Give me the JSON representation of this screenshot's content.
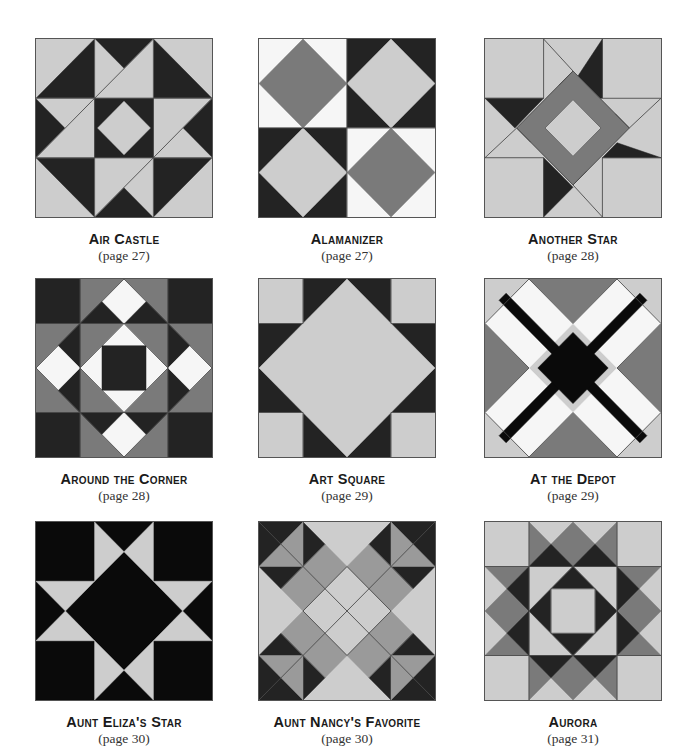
{
  "colors": {
    "L": "#cdcdcd",
    "D": "#232323",
    "M": "#7a7a7a",
    "G": "#9a9a9a",
    "W": "#f6f6f6",
    "K": "#0a0a0a",
    "line": "#4a4a4a"
  },
  "blocks": [
    {
      "title": "Air Castle",
      "page": "(page 27)",
      "x": 35,
      "y": 38,
      "shapes": [
        [
          "L",
          "0,0 100,0 100,100 0,100"
        ],
        [
          "D",
          "0,33.3 33.3,0 33.3,33.3"
        ],
        [
          "D",
          "66.7,0 100,33.3 66.7,33.3"
        ],
        [
          "D",
          "0,66.7 33.3,66.7 33.3,100"
        ],
        [
          "D",
          "66.7,66.7 100,66.7 66.7,100"
        ],
        [
          "D",
          "33.3,0 66.7,0 50,16.7"
        ],
        [
          "L",
          "33.3,0 50,16.7 33.3,33.3"
        ],
        [
          "L",
          "66.7,0 66.7,33.3 33.3,33.3 50,16.7"
        ],
        [
          "D",
          "0,33.3 16.7,50 0,66.7"
        ],
        [
          "L",
          "0,33.3 33.3,33.3 16.7,50"
        ],
        [
          "L",
          "16.7,50 33.3,33.3 33.3,66.7 0,66.7"
        ],
        [
          "D",
          "100,33.3 100,66.7 83.3,50"
        ],
        [
          "L",
          "66.7,33.3 100,33.3 83.3,50 66.7,66.7"
        ],
        [
          "L",
          "83.3,50 100,66.7 66.7,66.7"
        ],
        [
          "D",
          "33.3,100 50,83.3 66.7,100"
        ],
        [
          "L",
          "33.3,66.7 66.7,66.7 50,83.3 33.3,100"
        ],
        [
          "L",
          "50,83.3 66.7,66.7 66.7,100"
        ],
        [
          "D",
          "33.3,33.3 66.7,33.3 66.7,66.7 33.3,66.7"
        ],
        [
          "L",
          "50,35 65,50 50,65 35,50"
        ]
      ],
      "lines": [
        "33.3,0 33.3,100",
        "66.7,0 66.7,100",
        "0,33.3 100,33.3",
        "0,66.7 100,66.7",
        "33.3,33.3 66.7,0",
        "0,66.7 33.3,33.3",
        "66.7,66.7 100,33.3",
        "33.3,100 66.7,66.7"
      ]
    },
    {
      "title": "Alamanizer",
      "page": "(page 27)",
      "x": 258,
      "y": 38,
      "shapes": [
        [
          "W",
          "0,0 50,0 50,50 0,50"
        ],
        [
          "M",
          "25,0 50,25 25,50 0,25"
        ],
        [
          "D",
          "50,0 100,0 100,50 50,50"
        ],
        [
          "L",
          "75,0 100,25 75,50 50,25"
        ],
        [
          "D",
          "0,50 50,50 50,100 0,100"
        ],
        [
          "L",
          "25,50 50,75 25,100 0,75"
        ],
        [
          "W",
          "50,50 100,50 100,100 50,100"
        ],
        [
          "M",
          "75,50 100,75 75,100 50,75"
        ]
      ],
      "lines": [
        "50,0 50,100",
        "0,50 100,50"
      ]
    },
    {
      "title": "Another Star",
      "page": "(page 28)",
      "x": 484,
      "y": 38,
      "shapes": [
        [
          "L",
          "0,0 100,0 100,100 0,100"
        ],
        [
          "D",
          "50,25 66.7,0 66.7,33.3 58,33.3"
        ],
        [
          "D",
          "0,33.3 33.3,33.3 25,41.7 17,50"
        ],
        [
          "D",
          "75,58.3 100,66.7 66.7,66.7"
        ],
        [
          "D",
          "33.3,66.7 41.7,75 50,83.3 33.3,100"
        ],
        [
          "M",
          "50,25 75,50 50,75 25,50"
        ],
        [
          "M",
          "50,18 82,50 50,82 18,50"
        ],
        [
          "L",
          "50,34 66,50 50,66 34,50"
        ]
      ],
      "lines": [
        "33.3,0 33.3,33.3",
        "66.7,0 66.7,33.3",
        "0,33.3 33.3,33.3",
        "66.7,33.3 100,33.3",
        "0,66.7 33.3,66.7",
        "66.7,66.7 100,66.7",
        "33.3,66.7 33.3,100",
        "66.7,66.7 66.7,100",
        "33.3,0 50,18",
        "0,66.7 18,50",
        "100,33.3 82,50",
        "66.7,100 50,82",
        "50,18 82,50 50,82 18,50 50,18",
        "50,34 66,50 50,66 34,50 50,34",
        "50,18 42,26",
        "82,50 74,42",
        "50,82 58,74",
        "18,50 26,58"
      ]
    },
    {
      "title": "Around the Corner",
      "page": "(page 28)",
      "x": 35,
      "y": 278,
      "shapes": [
        [
          "M",
          "0,0 100,0 100,100 0,100"
        ],
        [
          "D",
          "0,0 25,0 25,25 0,25"
        ],
        [
          "D",
          "75,0 100,0 100,25 75,25"
        ],
        [
          "D",
          "0,75 25,75 25,100 0,100"
        ],
        [
          "D",
          "75,75 100,75 100,100 75,100"
        ],
        [
          "D",
          "25,25 50,25 37.5,12.5"
        ],
        [
          "D",
          "50,25 75,25 62.5,12.5"
        ],
        [
          "D",
          "25,25 25,50 12.5,37.5"
        ],
        [
          "D",
          "25,50 25,75 12.5,62.5"
        ],
        [
          "D",
          "75,25 75,50 87.5,37.5"
        ],
        [
          "D",
          "75,50 75,75 87.5,62.5"
        ],
        [
          "D",
          "25,75 50,75 37.5,87.5"
        ],
        [
          "D",
          "50,75 75,75 62.5,87.5"
        ],
        [
          "W",
          "50,0 62.5,12.5 50,25 37.5,12.5"
        ],
        [
          "W",
          "12.5,37.5 25,50 12.5,62.5 0,50"
        ],
        [
          "W",
          "87.5,37.5 100,50 87.5,62.5 75,50"
        ],
        [
          "W",
          "50,75 62.5,87.5 50,100 37.5,87.5"
        ],
        [
          "W",
          "50,25 75,50 50,75 25,50"
        ],
        [
          "D",
          "37.5,37.5 62.5,37.5 62.5,62.5 37.5,62.5"
        ]
      ],
      "lines": [
        "25,0 25,100",
        "75,0 75,100",
        "0,25 100,25",
        "0,75 100,75",
        "50,0 100,50 50,100 0,50 50,0",
        "50,25 75,50 50,75 25,50 50,25"
      ]
    },
    {
      "title": "Art Square",
      "page": "(page 29)",
      "x": 258,
      "y": 278,
      "shapes": [
        [
          "D",
          "0,0 100,0 100,100 0,100"
        ],
        [
          "L",
          "0,0 25,0 25,25 0,25"
        ],
        [
          "L",
          "75,0 100,0 100,25 75,25"
        ],
        [
          "L",
          "0,75 25,75 25,100 0,100"
        ],
        [
          "L",
          "75,75 100,75 100,100 75,100"
        ],
        [
          "L",
          "50,0 100,50 50,100 0,50"
        ]
      ],
      "lines": [
        "25,0 25,25",
        "75,0 75,25",
        "0,25 25,25",
        "75,25 100,25",
        "0,75 25,75",
        "75,75 100,75",
        "25,75 25,100",
        "75,75 75,100"
      ]
    },
    {
      "title": "At the Depot",
      "page": "(page 29)",
      "x": 484,
      "y": 278,
      "shapes": [
        [
          "L",
          "0,0 100,0 100,100 0,100"
        ],
        [
          "M",
          "25,0 75,0 50,25"
        ],
        [
          "M",
          "0,25 25,50 0,75"
        ],
        [
          "M",
          "100,25 100,75 75,50"
        ],
        [
          "M",
          "25,100 50,75 75,100"
        ],
        [
          "W",
          "25,0 50,25 25,50 0,25"
        ],
        [
          "W",
          "75,0 100,25 75,50 50,25"
        ],
        [
          "W",
          "0,75 25,50 50,75 25,100"
        ],
        [
          "W",
          "75,50 100,75 75,100 50,75"
        ],
        [
          "K",
          "12,8 50,46 88,8 92,12 54,50 92,88 88,92 50,54 12,92 8,88 46,50 8,12"
        ],
        [
          "K",
          "50,30 70,50 50,70 30,50"
        ]
      ],
      "lines": [
        "25,0 0,25",
        "75,0 100,25",
        "0,75 25,100",
        "100,75 75,100",
        "25,0 50,25 75,0",
        "0,25 25,50 0,75",
        "100,25 75,50 100,75",
        "25,100 50,75 75,100"
      ]
    },
    {
      "title": "Aunt Eliza's Star",
      "page": "(page 30)",
      "x": 35,
      "y": 521,
      "shapes": [
        [
          "K",
          "0,0 100,0 100,100 0,100"
        ],
        [
          "L",
          "33.3,0 50,16.7 33.3,33.3"
        ],
        [
          "L",
          "66.7,0 66.7,33.3 50,16.7"
        ],
        [
          "L",
          "0,33.3 33.3,33.3 16.7,50"
        ],
        [
          "L",
          "0,66.7 16.7,50 33.3,66.7"
        ],
        [
          "L",
          "100,33.3 83.3,50 66.7,33.3"
        ],
        [
          "L",
          "100,66.7 66.7,66.7 83.3,50"
        ],
        [
          "L",
          "33.3,66.7 50,83.3 33.3,100"
        ],
        [
          "L",
          "66.7,66.7 66.7,100 50,83.3"
        ]
      ],
      "lines": []
    },
    {
      "title": "Aunt Nancy's Favorite",
      "page": "(page 30)",
      "x": 258,
      "y": 521,
      "shapes": [
        [
          "L",
          "0,0 100,0 100,100 0,100"
        ],
        [
          "D",
          "0,0 25,0 25,25 0,25"
        ],
        [
          "D",
          "75,0 100,0 100,25 75,25"
        ],
        [
          "D",
          "0,75 25,75 25,100 0,100"
        ],
        [
          "D",
          "75,75 100,75 100,100 75,100"
        ],
        [
          "D",
          "25,0 37.5,12.5 25,25"
        ],
        [
          "D",
          "0,25 25,25 12.5,37.5"
        ],
        [
          "D",
          "75,0 75,25 62.5,12.5"
        ],
        [
          "D",
          "100,25 75,25 87.5,37.5"
        ],
        [
          "D",
          "0,75 25,75 12.5,62.5"
        ],
        [
          "D",
          "25,75 25,100 37.5,87.5"
        ],
        [
          "D",
          "75,75 100,75 87.5,62.5"
        ],
        [
          "D",
          "75,75 75,100 62.5,87.5"
        ],
        [
          "G",
          "0,25 25,0 25,25"
        ],
        [
          "G",
          "75,0 100,25 75,25"
        ],
        [
          "G",
          "0,75 25,75 25,100"
        ],
        [
          "G",
          "75,75 100,75 75,100"
        ],
        [
          "G",
          "37.5,12.5 50,25 25,50 12.5,37.5"
        ],
        [
          "G",
          "62.5,12.5 87.5,37.5 75,50 50,25"
        ],
        [
          "G",
          "12.5,62.5 25,50 50,75 37.5,87.5"
        ],
        [
          "G",
          "75,50 87.5,62.5 62.5,87.5 50,75"
        ]
      ],
      "lines": [
        "0,0 100,100",
        "100,0 0,100",
        "50,25 75,50 50,75 25,50 50,25",
        "37.5,12.5 12.5,37.5",
        "62.5,12.5 87.5,37.5",
        "12.5,62.5 37.5,87.5",
        "87.5,62.5 62.5,87.5"
      ]
    },
    {
      "title": "Aurora",
      "page": "(page 31)",
      "x": 484,
      "y": 521,
      "shapes": [
        [
          "L",
          "0,0 100,0 100,100 0,100"
        ],
        [
          "M",
          "25,0 37.5,12.5 25,25"
        ],
        [
          "M",
          "75,0 75,25 62.5,12.5"
        ],
        [
          "M",
          "37.5,12.5 50,0 62.5,12.5 50,25"
        ],
        [
          "D",
          "25,25 37.5,12.5 50,25"
        ],
        [
          "D",
          "50,25 62.5,12.5 75,25"
        ],
        [
          "M",
          "0,25 25,25 12.5,37.5"
        ],
        [
          "M",
          "0,50 12.5,37.5 25,50 12.5,62.5"
        ],
        [
          "M",
          "0,75 12.5,62.5 25,75"
        ],
        [
          "D",
          "25,25 25,50 12.5,37.5"
        ],
        [
          "D",
          "25,50 25,75 12.5,62.5"
        ],
        [
          "M",
          "100,25 87.5,37.5 75,25"
        ],
        [
          "M",
          "100,50 87.5,62.5 75,50 87.5,37.5"
        ],
        [
          "M",
          "100,75 75,75 87.5,62.5"
        ],
        [
          "D",
          "75,25 87.5,37.5 75,50"
        ],
        [
          "D",
          "75,50 87.5,62.5 75,75"
        ],
        [
          "M",
          "25,100 37.5,87.5 25,75"
        ],
        [
          "M",
          "75,100 75,75 62.5,87.5"
        ],
        [
          "M",
          "37.5,87.5 50,75 62.5,87.5 50,100"
        ],
        [
          "D",
          "25,75 50,75 37.5,87.5"
        ],
        [
          "D",
          "50,75 75,75 62.5,87.5"
        ],
        [
          "D",
          "50,25 75,50 50,75 25,50"
        ],
        [
          "L",
          "37.5,37.5 62.5,37.5 62.5,62.5 37.5,62.5"
        ]
      ],
      "lines": [
        "25,0 25,100",
        "75,0 75,100",
        "0,25 100,25",
        "0,75 100,75",
        "50,25 75,50 50,75 25,50 50,25",
        "37.5,37.5 62.5,37.5 62.5,62.5 37.5,62.5 37.5,37.5"
      ]
    }
  ]
}
